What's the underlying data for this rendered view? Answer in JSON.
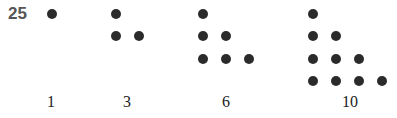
{
  "figure_number": "25",
  "dot_color": "#2b2b2b",
  "groups": [
    {
      "label": "1",
      "rows": [
        1
      ]
    },
    {
      "label": "3",
      "rows": [
        1,
        2
      ]
    },
    {
      "label": "6",
      "rows": [
        1,
        2,
        3
      ]
    },
    {
      "label": "10",
      "rows": [
        1,
        2,
        3,
        4
      ]
    }
  ]
}
